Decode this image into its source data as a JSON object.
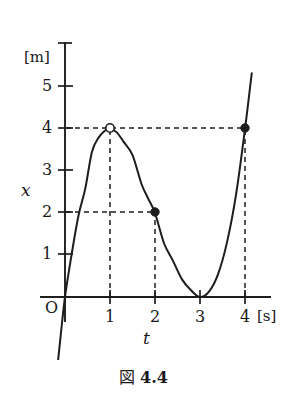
{
  "caption": {
    "prefix": "図",
    "number": "4.4"
  },
  "axes": {
    "y_unit_label": "[m]",
    "x_unit_label": "[s]",
    "y_variable_label": "x",
    "x_variable_label": "t",
    "origin_label": "O"
  },
  "chart_data": {
    "type": "line",
    "xlabel": "t",
    "ylabel": "x",
    "x_unit": "[s]",
    "y_unit": "[m]",
    "xlim": [
      -0.3,
      4.6
    ],
    "ylim": [
      -1.2,
      5.7
    ],
    "xticks": [
      0,
      1,
      2,
      3,
      4
    ],
    "xtick_labels": [
      "O",
      "1",
      "2",
      "3",
      "4"
    ],
    "yticks": [
      1,
      2,
      3,
      4,
      5
    ],
    "ytick_labels": [
      "1",
      "2",
      "3",
      "4",
      "5"
    ],
    "grid": false,
    "legend": false,
    "curve_equation": "x = t(t-3)^2",
    "series": [
      {
        "name": "x(t)",
        "color": "#1d1d1d",
        "x": [
          -0.22,
          -0.1,
          0.0,
          0.15,
          0.3,
          0.45,
          0.6,
          0.75,
          0.9,
          1.0,
          1.15,
          1.3,
          1.5,
          1.7,
          1.85,
          2.0,
          2.2,
          2.4,
          2.6,
          2.8,
          3.0,
          3.2,
          3.4,
          3.6,
          3.8,
          4.0,
          4.15
        ],
        "y": [
          -2.2,
          -0.96,
          0.0,
          1.03,
          1.94,
          2.58,
          3.46,
          3.8,
          3.97,
          4.0,
          3.92,
          3.7,
          3.38,
          2.69,
          2.34,
          2.0,
          1.28,
          0.86,
          0.42,
          0.16,
          0.0,
          0.13,
          0.54,
          1.3,
          2.43,
          4.0,
          5.33
        ]
      }
    ],
    "markers": [
      {
        "x": 2,
        "y": 2,
        "style": "filled",
        "label": "(2, 2)"
      },
      {
        "x": 4,
        "y": 4,
        "style": "filled",
        "label": "(4, 4)"
      },
      {
        "x": 1,
        "y": 4,
        "style": "open",
        "label": "(1, 4)"
      }
    ],
    "guides": [
      {
        "from": [
          0,
          4
        ],
        "to": [
          4,
          4
        ],
        "orientation": "horizontal",
        "style": "dashed"
      },
      {
        "from": [
          0,
          2
        ],
        "to": [
          2,
          2
        ],
        "orientation": "horizontal",
        "style": "dashed"
      },
      {
        "from": [
          1,
          0
        ],
        "to": [
          1,
          4
        ],
        "orientation": "vertical",
        "style": "dashed"
      },
      {
        "from": [
          2,
          0
        ],
        "to": [
          2,
          2
        ],
        "orientation": "vertical",
        "style": "dashed"
      },
      {
        "from": [
          4,
          0
        ],
        "to": [
          4,
          4
        ],
        "orientation": "vertical",
        "style": "dashed"
      }
    ]
  }
}
